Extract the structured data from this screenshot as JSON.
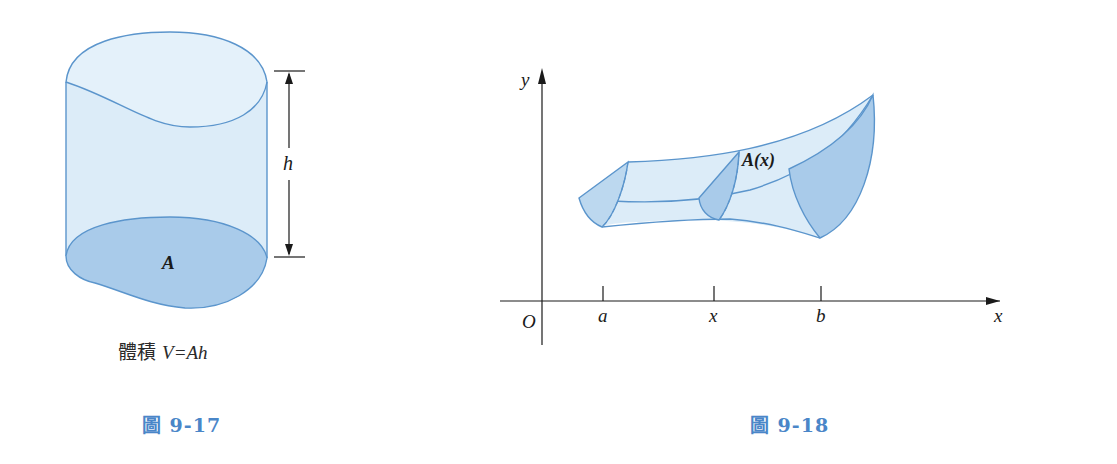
{
  "figures": [
    {
      "id": "fig-9-17",
      "caption": "圖 9-17",
      "caption_prefix": "圖",
      "caption_number": "9-17",
      "base_label": "A",
      "height_label": "h",
      "formula_prefix": "體積",
      "formula": "V=Ah"
    },
    {
      "id": "fig-9-18",
      "caption": "圖 9-18",
      "caption_prefix": "圖",
      "caption_number": "9-18",
      "cross_section_label": "A(x)",
      "y_axis_label": "y",
      "x_axis_label": "x",
      "origin_label": "O",
      "ticks": [
        "a",
        "x",
        "b"
      ]
    }
  ],
  "colors": {
    "solid_fill": "#dcecf8",
    "base_fill": "#a9cbea",
    "outline": "#5b95cc",
    "caption": "#4a86c8"
  }
}
